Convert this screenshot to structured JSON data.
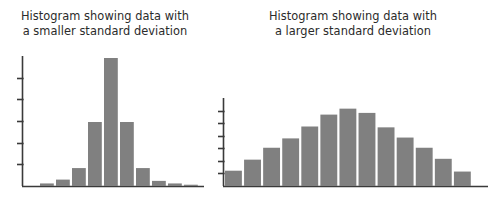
{
  "figure": {
    "background_color": "#ffffff",
    "bar_color": "#808080",
    "axis_color": "#3a3a3a",
    "title_color": "#2b2b2b"
  },
  "panels": [
    {
      "name": "smaller-sd-histogram",
      "title_line1": "Histogram showing data with",
      "title_line2": "a smaller standard deviation"
    },
    {
      "name": "larger-sd-histogram",
      "title_line1": "Histogram showing data with",
      "title_line2": "a larger standard deviation"
    }
  ],
  "chart_data": [
    {
      "type": "bar",
      "name": "smaller-sd-histogram",
      "title": "Histogram showing data with a smaller standard deviation",
      "xlabel": "",
      "ylabel": "",
      "grid": false,
      "legend": false,
      "axis_ticks_y": 5,
      "ylim": [
        0,
        100
      ],
      "categories": [
        "b1",
        "b2",
        "b3",
        "b4",
        "b5",
        "b6",
        "b7",
        "b8",
        "b9",
        "b10",
        "b11"
      ],
      "values": [
        0,
        2,
        5,
        14,
        50,
        100,
        50,
        14,
        4,
        2,
        1
      ]
    },
    {
      "type": "bar",
      "name": "larger-sd-histogram",
      "title": "Histogram showing data with a larger standard deviation",
      "xlabel": "",
      "ylabel": "",
      "grid": false,
      "legend": false,
      "axis_ticks_y": 6,
      "ylim": [
        0,
        100
      ],
      "categories": [
        "b1",
        "b2",
        "b3",
        "b4",
        "b5",
        "b6",
        "b7",
        "b8",
        "b9",
        "b10",
        "b11",
        "b12",
        "b13"
      ],
      "values": [
        18,
        31,
        45,
        56,
        70,
        84,
        91,
        86,
        69,
        57,
        45,
        32,
        17
      ]
    }
  ]
}
